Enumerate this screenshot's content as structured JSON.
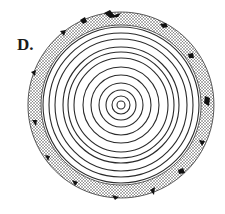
{
  "figure": {
    "label": "D.",
    "center": [
      121,
      105
    ],
    "bark": {
      "outer_radius": 93,
      "inner_radius": 80,
      "fill": "stippled",
      "color": "#222222"
    },
    "rings": {
      "count": 12,
      "radii": [
        4,
        9,
        15,
        22,
        30,
        38,
        47,
        53,
        58,
        66,
        72,
        78
      ],
      "stroke": "#2a2a2a"
    }
  }
}
